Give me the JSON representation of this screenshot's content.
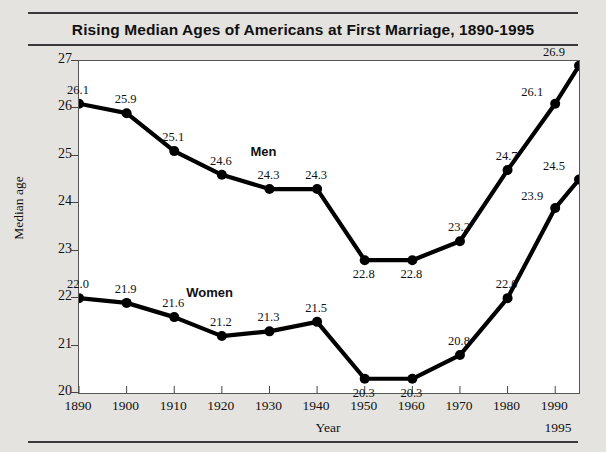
{
  "chart_data": {
    "type": "line",
    "title": "Rising Median Ages of Americans at First Marriage, 1890-1995",
    "xlabel": "Year",
    "ylabel": "Median age",
    "x": [
      1890,
      1900,
      1910,
      1920,
      1930,
      1940,
      1950,
      1960,
      1970,
      1980,
      1990,
      1995
    ],
    "xtick_labels": [
      "1890",
      "1900",
      "1910",
      "1920",
      "1930",
      "1940",
      "1950",
      "1960",
      "1970",
      "1980",
      "1990"
    ],
    "end_tick_label": "1995",
    "ytick_labels": [
      "27",
      "26",
      "25",
      "24",
      "23",
      "22",
      "21",
      "20"
    ],
    "yticks": [
      27,
      26,
      25,
      24,
      23,
      22,
      21,
      20
    ],
    "xlim": [
      1890,
      1995
    ],
    "ylim": [
      20,
      27
    ],
    "grid": false,
    "legend": "inline-series-labels",
    "marker": "filled-circle",
    "series": [
      {
        "name": "Men",
        "color": "#000000",
        "values": [
          26.1,
          25.9,
          25.1,
          24.6,
          24.3,
          24.3,
          22.8,
          22.8,
          23.2,
          24.7,
          26.1,
          26.9
        ],
        "labels": [
          "26.1",
          "25.9",
          "25.1",
          "24.6",
          "24.3",
          "24.3",
          "22.8",
          "22.8",
          "23.2",
          "24.7",
          "26.1",
          "26.9"
        ]
      },
      {
        "name": "Women",
        "color": "#000000",
        "values": [
          22.0,
          21.9,
          21.6,
          21.2,
          21.3,
          21.5,
          20.3,
          20.3,
          20.8,
          22.0,
          23.9,
          24.5
        ],
        "labels": [
          "22.0",
          "21.9",
          "21.6",
          "21.2",
          "21.3",
          "21.5",
          "20.3",
          "20.3",
          "20.8",
          "22.0",
          "23.9",
          "24.5"
        ]
      }
    ],
    "series_label_positions": [
      {
        "name": "Men",
        "x": 1930,
        "y": 25.05
      },
      {
        "name": "Women",
        "x": 1916.5,
        "y": 22.08
      }
    ],
    "point_label_placement": {
      "Men": [
        "above",
        "above",
        "above",
        "above",
        "above",
        "above",
        "below",
        "below",
        "above",
        "above",
        "left",
        "above"
      ],
      "Women": [
        "above",
        "above",
        "above",
        "above",
        "above",
        "above",
        "below",
        "below",
        "above",
        "above",
        "left",
        "above"
      ]
    }
  }
}
